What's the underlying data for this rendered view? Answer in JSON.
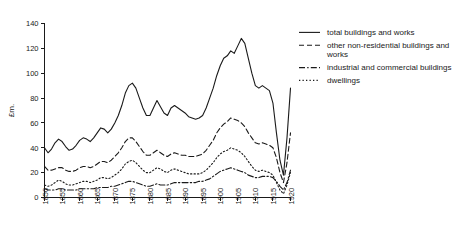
{
  "chart_data": {
    "type": "line",
    "title": "",
    "xlabel": "",
    "ylabel": "£m.",
    "xlim": [
      1850,
      1920
    ],
    "ylim": [
      0,
      140
    ],
    "grid": false,
    "legend_position": "right",
    "xticks": [
      "1850",
      "1855",
      "1860",
      "1865",
      "1870",
      "1875",
      "1880",
      "1885",
      "1890",
      "1895",
      "1900",
      "1905",
      "1910",
      "1915",
      "1920"
    ],
    "yticks": [
      "0",
      "20",
      "40",
      "60",
      "80",
      "100",
      "120",
      "140"
    ],
    "x": [
      1850,
      1851,
      1852,
      1853,
      1854,
      1855,
      1856,
      1857,
      1858,
      1859,
      1860,
      1861,
      1862,
      1863,
      1864,
      1865,
      1866,
      1867,
      1868,
      1869,
      1870,
      1871,
      1872,
      1873,
      1874,
      1875,
      1876,
      1877,
      1878,
      1879,
      1880,
      1881,
      1882,
      1883,
      1884,
      1885,
      1886,
      1887,
      1888,
      1889,
      1890,
      1891,
      1892,
      1893,
      1894,
      1895,
      1896,
      1897,
      1898,
      1899,
      1900,
      1901,
      1902,
      1903,
      1904,
      1905,
      1906,
      1907,
      1908,
      1909,
      1910,
      1911,
      1912,
      1913,
      1914,
      1915,
      1916,
      1917,
      1918,
      1919,
      1920
    ],
    "series": [
      {
        "name": "total buildings and works",
        "style": "solid",
        "values": [
          40,
          36,
          39,
          44,
          47,
          45,
          41,
          38,
          39,
          42,
          46,
          48,
          47,
          45,
          48,
          52,
          56,
          55,
          52,
          55,
          60,
          66,
          74,
          84,
          90,
          92,
          88,
          80,
          72,
          66,
          66,
          72,
          78,
          73,
          68,
          66,
          72,
          74,
          72,
          70,
          68,
          65,
          64,
          63,
          64,
          66,
          72,
          80,
          88,
          98,
          106,
          112,
          114,
          118,
          116,
          122,
          128,
          124,
          112,
          100,
          90,
          88,
          90,
          88,
          86,
          76,
          52,
          30,
          18,
          48,
          88
        ]
      },
      {
        "name": "other non-residential buildings and works",
        "style": "dashed",
        "values": [
          25,
          22,
          22,
          23,
          24,
          24,
          22,
          21,
          21,
          22,
          24,
          25,
          25,
          24,
          25,
          27,
          29,
          29,
          28,
          30,
          33,
          36,
          40,
          45,
          48,
          48,
          45,
          41,
          37,
          34,
          34,
          36,
          38,
          36,
          34,
          33,
          35,
          36,
          35,
          34,
          34,
          33,
          33,
          33,
          34,
          35,
          38,
          42,
          46,
          52,
          56,
          59,
          61,
          64,
          63,
          62,
          60,
          57,
          52,
          48,
          44,
          43,
          44,
          43,
          42,
          40,
          32,
          20,
          12,
          28,
          52
        ]
      },
      {
        "name": "industrial and commercial buildings",
        "style": "dashdot",
        "values": [
          7,
          6,
          6,
          6,
          7,
          7,
          6,
          6,
          6,
          6,
          7,
          7,
          7,
          7,
          7,
          8,
          8,
          8,
          8,
          9,
          9,
          10,
          11,
          12,
          13,
          13,
          12,
          11,
          10,
          9,
          9,
          10,
          11,
          10,
          10,
          10,
          11,
          12,
          12,
          12,
          12,
          12,
          12,
          12,
          13,
          13,
          14,
          15,
          17,
          19,
          21,
          22,
          23,
          24,
          23,
          22,
          21,
          20,
          18,
          17,
          16,
          16,
          17,
          17,
          17,
          16,
          13,
          9,
          6,
          12,
          22
        ]
      },
      {
        "name": "dwellings",
        "style": "dotted",
        "values": [
          10,
          9,
          10,
          12,
          14,
          13,
          11,
          10,
          10,
          11,
          12,
          13,
          13,
          12,
          13,
          14,
          16,
          16,
          15,
          16,
          18,
          20,
          23,
          27,
          29,
          30,
          28,
          25,
          22,
          20,
          20,
          22,
          24,
          23,
          21,
          20,
          22,
          23,
          22,
          21,
          20,
          19,
          19,
          19,
          19,
          20,
          22,
          25,
          28,
          32,
          35,
          37,
          38,
          40,
          39,
          38,
          36,
          33,
          29,
          25,
          22,
          21,
          22,
          21,
          20,
          18,
          12,
          6,
          3,
          10,
          20
        ]
      }
    ]
  },
  "legend": {
    "items": [
      {
        "label": "total buildings and works",
        "style": "solid"
      },
      {
        "label": "other non-residential buildings and works",
        "style": "dashed"
      },
      {
        "label": "industrial and commercial buildings",
        "style": "dashdot"
      },
      {
        "label": "dwellings",
        "style": "dotted"
      }
    ]
  }
}
